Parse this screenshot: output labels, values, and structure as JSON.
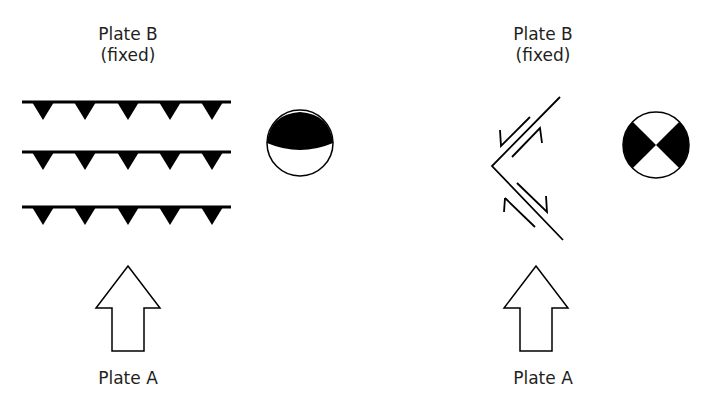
{
  "left_panel": {
    "top_label_line1": "Plate B",
    "top_label_line2": "(fixed)",
    "bottom_label": "Plate A",
    "fault_type": "thrust-faults",
    "focal_mechanism": "reverse-fault-beachball"
  },
  "right_panel": {
    "top_label_line1": "Plate B",
    "top_label_line2": "(fixed)",
    "bottom_label": "Plate A",
    "fault_type": "conjugate-strike-slip-faults",
    "focal_mechanism": "strike-slip-beachball"
  },
  "colors": {
    "ink": "#000000",
    "text": "#231f20",
    "background": "#ffffff"
  }
}
